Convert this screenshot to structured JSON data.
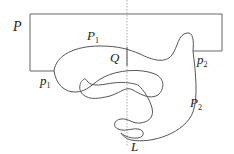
{
  "diagram": {
    "labels": {
      "P": "P",
      "P1": {
        "base": "P",
        "sub": "1"
      },
      "P2": {
        "base": "P",
        "sub": "2"
      },
      "p1": {
        "base": "p",
        "sub": "1"
      },
      "p2": {
        "base": "p",
        "sub": "2"
      },
      "Q": "Q",
      "L": "L"
    },
    "colors": {
      "stroke": "#555555",
      "dashed": "#888888",
      "text": "#222222"
    }
  }
}
